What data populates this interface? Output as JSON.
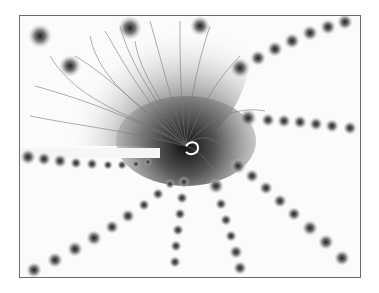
{
  "image": {
    "subject": "grayscale fractal (Mandelbrot set detail with spiral center and radiating bulb chains)",
    "frame": {
      "x": 19,
      "y": 15,
      "width": 342,
      "height": 263,
      "border_color": "#6a6a6a"
    },
    "colors": {
      "background": "#ffffff",
      "fill": "#fbfbfb",
      "dark": "#1a1a1a",
      "mid": "#7a7a7a",
      "light": "#d0d0d0"
    },
    "spiral_center": {
      "x": 166,
      "y": 130
    },
    "arms": [
      {
        "name": "upper-right",
        "to": [
          340,
          4
        ]
      },
      {
        "name": "right",
        "to": [
          342,
          116
        ]
      },
      {
        "name": "lower-right",
        "to": [
          332,
          252
        ]
      },
      {
        "name": "down",
        "to": [
          232,
          262
        ]
      },
      {
        "name": "down-left",
        "to": [
          158,
          262
        ]
      },
      {
        "name": "lower-left",
        "to": [
          6,
          258
        ]
      },
      {
        "name": "left",
        "to": [
          0,
          140
        ]
      }
    ]
  }
}
